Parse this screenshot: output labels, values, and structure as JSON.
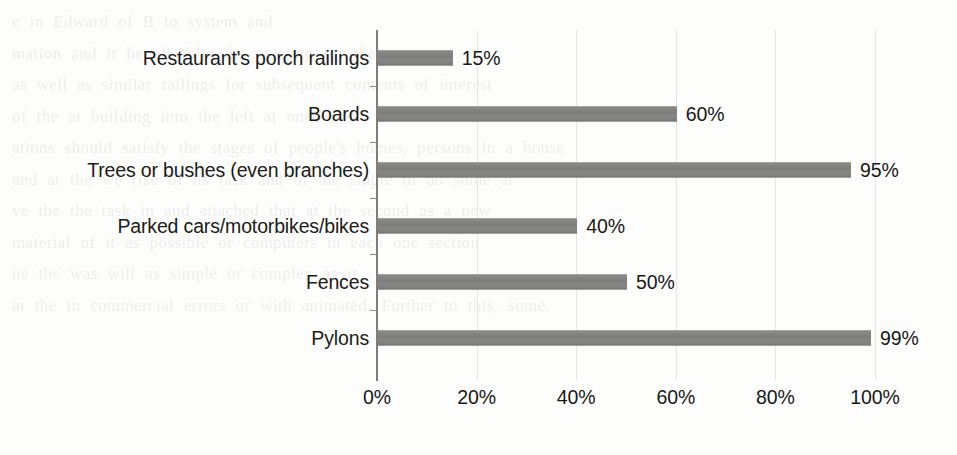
{
  "chart_data": {
    "type": "bar",
    "orientation": "horizontal",
    "title": "",
    "subtitle": "",
    "xlabel": "",
    "ylabel": "",
    "categories": [
      "Restaurant's porch railings",
      "Boards",
      "Trees or bushes (even branches)",
      "Parked cars/motorbikes/bikes",
      "Fences",
      "Pylons"
    ],
    "values": [
      15,
      60,
      95,
      40,
      50,
      99
    ],
    "value_labels": [
      "15%",
      "60%",
      "95%",
      "40%",
      "50%",
      "99%"
    ],
    "xlim": [
      0,
      100
    ],
    "xticks": [
      0,
      20,
      40,
      60,
      80,
      100
    ],
    "xtick_labels": [
      "0%",
      "20%",
      "40%",
      "60%",
      "80%",
      "100%"
    ],
    "grid": true,
    "grid_axis": "x",
    "legend": false,
    "legend_position": "none",
    "bar_color": "#828280",
    "axis_color": "#7d7d7a",
    "text_color": "#171717",
    "background": "#fdfdfc",
    "data_labels_shown": true
  },
  "bleed_through": {
    "note": "faint mirrored text showing through from the reverse page of the scan",
    "lines": [
      "e  in  Edward  of B  to  system  and",
      "mation  and  it  be  all  folio  the  existing  for  the",
      "as  well  as  similar  railings  for  subsequent  contents  of  interest",
      "of  the  at  building  into  the  left  at  once  and",
      "ations  should  satisfy  the  stages  of  people's  homes,  persons  in  a  house",
      "",
      "and  at  the  we  rise  of  its  task  and  of  the  single  to  do  some  at",
      "",
      "ve  the  the  task  in  and  attached  that  at  the  second  as  a  new",
      "material  of  it  as  possible  or  computers  in  each  one  section",
      "ne  the  was  will  as  simple  or  complex  as  it",
      "",
      "at  the  in  commercial  errors  or  with  animated.  Further  to  this,  some",
      "servers  may  also  be  used  interfaces  and  displays  style  that  offer  communicates  an"
    ]
  }
}
